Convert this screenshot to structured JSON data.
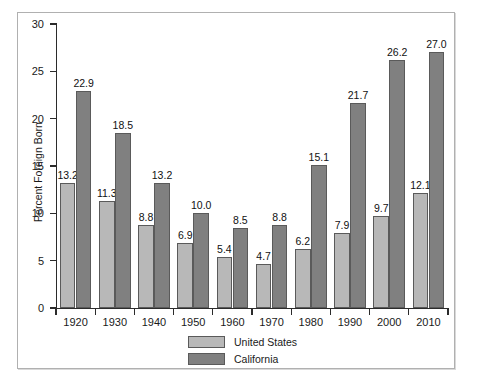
{
  "chart_data": {
    "type": "bar",
    "title": "",
    "subtitle": "",
    "xlabel": "",
    "ylabel": "Percent Foreign Born",
    "ylim": [
      0,
      30
    ],
    "yticks": [
      0,
      5,
      10,
      15,
      20,
      25,
      30
    ],
    "ytick_labels": [
      "0",
      "5",
      "10",
      "15",
      "20",
      "25",
      "30"
    ],
    "grid": false,
    "legend_position": "bottom-center",
    "categories": [
      "1920",
      "1930",
      "1940",
      "1950",
      "1960",
      "1970",
      "1980",
      "1990",
      "2000",
      "2010"
    ],
    "series": [
      {
        "name": "United States",
        "color": "#b8b8b8",
        "values": [
          13.2,
          11.3,
          8.8,
          6.9,
          5.4,
          4.7,
          6.2,
          7.9,
          9.7,
          12.1
        ],
        "labels": [
          "13.2",
          "11.3",
          "8.8",
          "6.9",
          "5.4",
          "4.7",
          "6.2",
          "7.9",
          "9.7",
          "12.1"
        ]
      },
      {
        "name": "California",
        "color": "#808080",
        "values": [
          22.9,
          18.5,
          13.2,
          10.0,
          8.5,
          8.8,
          15.1,
          21.7,
          26.2,
          27.0
        ],
        "labels": [
          "22.9",
          "18.5",
          "13.2",
          "10.0",
          "8.5",
          "8.8",
          "15.1",
          "21.7",
          "26.2",
          "27.0"
        ]
      }
    ]
  },
  "legend": {
    "entries": [
      {
        "label": "United States",
        "color": "#b8b8b8"
      },
      {
        "label": "California",
        "color": "#808080"
      }
    ]
  },
  "colors": {
    "united_states": "#b8b8b8",
    "california": "#808080",
    "axis": "#2b2b2b",
    "frame": "#b0b0b0",
    "background": "#ffffff"
  }
}
